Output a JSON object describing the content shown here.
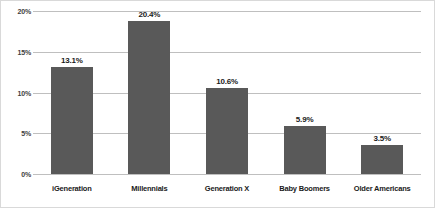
{
  "chart_data": {
    "type": "bar",
    "title": "",
    "xlabel": "",
    "ylabel": "",
    "categories": [
      "iGeneration",
      "Millennials",
      "Generation X",
      "Baby Boomers",
      "Older Americans"
    ],
    "values": [
      13.1,
      20.4,
      10.6,
      5.9,
      3.5
    ],
    "value_labels": [
      "13.1%",
      "20.4%",
      "10.6%",
      "5.9%",
      "3.5%"
    ],
    "ylim": [
      0,
      20
    ],
    "yticks": [
      0,
      5,
      10,
      15,
      20
    ],
    "ytick_labels": [
      "0%",
      "5%",
      "10%",
      "15%",
      "20%"
    ],
    "grid": true,
    "legend": "none",
    "bar_color": "#595959",
    "gridline_color": "#bfbfbf",
    "border_color": "#d9d9d9",
    "label_color": "#1a1a1a"
  }
}
